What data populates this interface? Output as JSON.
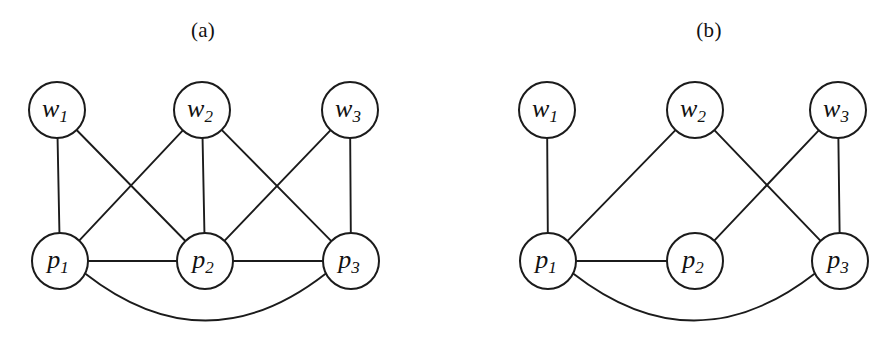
{
  "figure": {
    "background_color": "#ffffff",
    "stroke_color": "#1b1b1b",
    "node_fill": "#ffffff",
    "node_radius": 28,
    "panels": [
      {
        "id": "panel-a",
        "caption": "(a)",
        "caption_x": 203,
        "caption_y": 32,
        "nodes": [
          {
            "id": "a-w1",
            "label_base": "w",
            "label_sub": "1",
            "x": 57,
            "y": 110,
            "r": 28
          },
          {
            "id": "a-w2",
            "label_base": "w",
            "label_sub": "2",
            "x": 202,
            "y": 110,
            "r": 28
          },
          {
            "id": "a-w3",
            "label_base": "w",
            "label_sub": "3",
            "x": 350,
            "y": 110,
            "r": 28
          },
          {
            "id": "a-p1",
            "label_base": "p",
            "label_sub": "1",
            "x": 60,
            "y": 261,
            "r": 28
          },
          {
            "id": "a-p2",
            "label_base": "p",
            "label_sub": "2",
            "x": 205,
            "y": 261,
            "r": 28
          },
          {
            "id": "a-p3",
            "label_base": "p",
            "label_sub": "3",
            "x": 351,
            "y": 261,
            "r": 28
          }
        ],
        "edges": [
          {
            "id": "a-e-w1p1",
            "from": "a-w1",
            "to": "a-p1",
            "type": "line"
          },
          {
            "id": "a-e-w1p2",
            "from": "a-w1",
            "to": "a-p2",
            "type": "line"
          },
          {
            "id": "a-e-w2p1",
            "from": "a-w2",
            "to": "a-p1",
            "type": "line"
          },
          {
            "id": "a-e-w2p2",
            "from": "a-w2",
            "to": "a-p2",
            "type": "line"
          },
          {
            "id": "a-e-w2p3",
            "from": "a-w2",
            "to": "a-p3",
            "type": "line"
          },
          {
            "id": "a-e-w3p2",
            "from": "a-w3",
            "to": "a-p2",
            "type": "line"
          },
          {
            "id": "a-e-w3p3",
            "from": "a-w3",
            "to": "a-p3",
            "type": "line"
          },
          {
            "id": "a-e-p1p2",
            "from": "a-p1",
            "to": "a-p2",
            "type": "line"
          },
          {
            "id": "a-e-p2p3",
            "from": "a-p2",
            "to": "a-p3",
            "type": "line"
          },
          {
            "id": "a-e-p1p3",
            "from": "a-p1",
            "to": "a-p3",
            "type": "arc",
            "sag": 72
          }
        ]
      },
      {
        "id": "panel-b",
        "caption": "(b)",
        "caption_x": 709,
        "caption_y": 32,
        "nodes": [
          {
            "id": "b-w1",
            "label_base": "w",
            "label_sub": "1",
            "x": 547,
            "y": 110,
            "r": 28
          },
          {
            "id": "b-w2",
            "label_base": "w",
            "label_sub": "2",
            "x": 695,
            "y": 110,
            "r": 28
          },
          {
            "id": "b-w3",
            "label_base": "w",
            "label_sub": "3",
            "x": 838,
            "y": 110,
            "r": 28
          },
          {
            "id": "b-p1",
            "label_base": "p",
            "label_sub": "1",
            "x": 548,
            "y": 261,
            "r": 28
          },
          {
            "id": "b-p2",
            "label_base": "p",
            "label_sub": "2",
            "x": 695,
            "y": 261,
            "r": 28
          },
          {
            "id": "b-p3",
            "label_base": "p",
            "label_sub": "3",
            "x": 840,
            "y": 261,
            "r": 28
          }
        ],
        "edges": [
          {
            "id": "b-e-w1p1",
            "from": "b-w1",
            "to": "b-p1",
            "type": "line"
          },
          {
            "id": "b-e-w2p1",
            "from": "b-w2",
            "to": "b-p1",
            "type": "line"
          },
          {
            "id": "b-e-w2p3",
            "from": "b-w2",
            "to": "b-p3",
            "type": "line"
          },
          {
            "id": "b-e-w3p2",
            "from": "b-w3",
            "to": "b-p2",
            "type": "line"
          },
          {
            "id": "b-e-w3p3",
            "from": "b-w3",
            "to": "b-p3",
            "type": "line"
          },
          {
            "id": "b-e-p1p2",
            "from": "b-p1",
            "to": "b-p2",
            "type": "line"
          },
          {
            "id": "b-e-p1p3",
            "from": "b-p1",
            "to": "b-p3",
            "type": "arc",
            "sag": 72
          }
        ]
      }
    ]
  }
}
